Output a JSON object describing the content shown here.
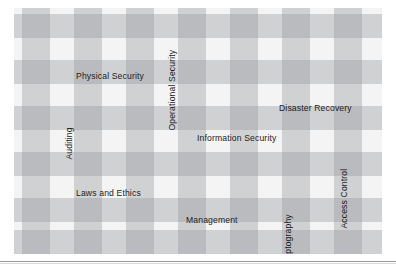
{
  "figure": {
    "background_color": "#ffffff",
    "band_color": "#96989a",
    "text_color": "#1c1c1c",
    "rule_color": "#9a9a9a"
  },
  "labels": [
    {
      "text": "Physical Security",
      "orientation": "horizontal",
      "x": 62,
      "y": 64
    },
    {
      "text": "Operational Security",
      "orientation": "vertical",
      "x": 163,
      "y": 114
    },
    {
      "text": "Disaster Recovery",
      "orientation": "horizontal",
      "x": 265,
      "y": 96
    },
    {
      "text": "Auditing",
      "orientation": "vertical",
      "x": 60,
      "y": 143
    },
    {
      "text": "Information Security",
      "orientation": "horizontal",
      "x": 183,
      "y": 126
    },
    {
      "text": "Access Control",
      "orientation": "vertical",
      "x": 335,
      "y": 212
    },
    {
      "text": "Laws and Ethics",
      "orientation": "horizontal",
      "x": 62,
      "y": 181
    },
    {
      "text": "Management",
      "orientation": "horizontal",
      "x": 172,
      "y": 208
    },
    {
      "text": "Cryptography",
      "orientation": "vertical",
      "x": 279,
      "y": 251
    }
  ],
  "pattern": {
    "type": "plaid",
    "vertical_bands": [
      {
        "x": 8,
        "w": 28
      },
      {
        "x": 60,
        "w": 28
      },
      {
        "x": 112,
        "w": 28
      },
      {
        "x": 164,
        "w": 28
      },
      {
        "x": 216,
        "w": 28
      },
      {
        "x": 268,
        "w": 28
      },
      {
        "x": 320,
        "w": 28
      }
    ],
    "horizontal_bands": [
      {
        "y": 6,
        "h": 24
      },
      {
        "y": 52,
        "h": 24
      },
      {
        "y": 98,
        "h": 24
      },
      {
        "y": 144,
        "h": 24
      },
      {
        "y": 190,
        "h": 24
      },
      {
        "y": 222,
        "h": 24
      }
    ]
  },
  "chart_data": {
    "type": "table",
    "categories": [
      "Physical Security",
      "Operational Security",
      "Disaster Recovery",
      "Auditing",
      "Information Security",
      "Access Control",
      "Laws and Ethics",
      "Management",
      "Cryptography"
    ],
    "values": [
      1,
      1,
      1,
      1,
      1,
      1,
      1,
      1,
      1
    ],
    "xlabel": "",
    "ylabel": "",
    "legend": []
  }
}
